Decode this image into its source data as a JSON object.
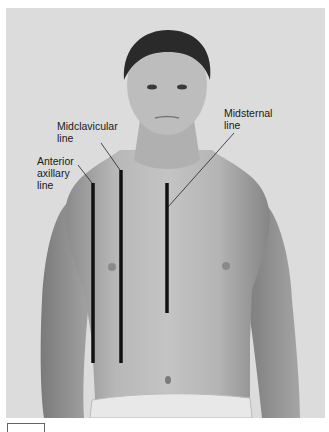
{
  "figure": {
    "background_color": "#dcdcdc",
    "line_color": "#111111"
  },
  "labels": {
    "midclavicular": "Midclavicular\nline",
    "anterior_axillary": "Anterior\naxillary\nline",
    "midsternal": "Midsternal\nline"
  },
  "lines": [
    {
      "name": "anterior-axillary-line",
      "x": 93,
      "y1": 183,
      "y2": 363
    },
    {
      "name": "midclavicular-line",
      "x": 121,
      "y1": 170,
      "y2": 363
    },
    {
      "name": "midsternal-line",
      "x": 167,
      "y1": 183,
      "y2": 313
    }
  ]
}
